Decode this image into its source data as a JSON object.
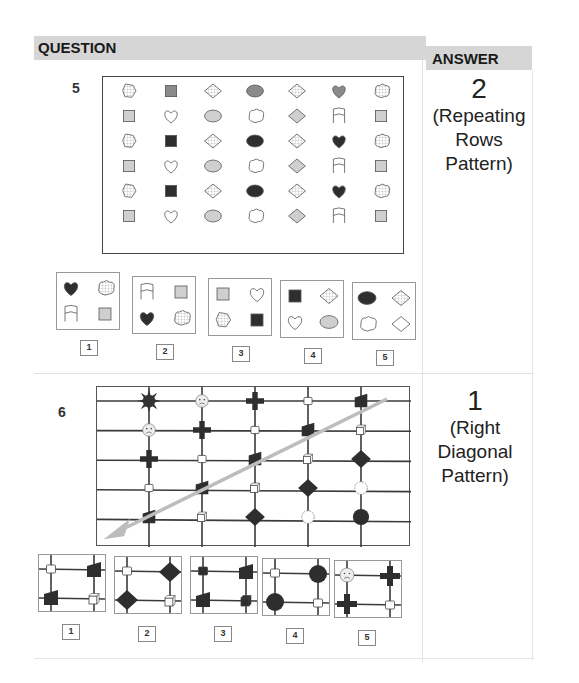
{
  "header": {
    "question_label": "QUESTION",
    "answer_label": "ANSWER"
  },
  "questions": [
    {
      "number": "5",
      "answer_number": "2",
      "answer_text_lines": [
        "(Repeating",
        "Rows",
        "Pattern)"
      ],
      "matrix_rows": [
        [
          "pentagon-hatched",
          "square-gray",
          "diamond-hatched",
          "ellipse-gray",
          "diamond-hatched",
          "heart-gray",
          "cloud-hatched"
        ],
        [
          "square-light",
          "heart-outline",
          "ellipse-light",
          "cloud-outline",
          "diamond-light",
          "banner-outline",
          "square-light"
        ],
        [
          "pentagon-hatched",
          "square-dark",
          "diamond-hatched",
          "ellipse-dark",
          "diamond-hatched",
          "heart-dark",
          "cloud-hatched"
        ],
        [
          "square-light",
          "heart-outline",
          "ellipse-light",
          "cloud-outline",
          "diamond-light",
          "banner-outline",
          "square-light"
        ],
        [
          "pentagon-hatched",
          "square-dark",
          "diamond-hatched",
          "ellipse-dark",
          "diamond-hatched",
          "heart-dark",
          "cloud-hatched"
        ],
        [
          "square-light",
          "heart-outline",
          "ellipse-light",
          "cloud-outline",
          "diamond-light",
          "banner-outline",
          "square-light"
        ]
      ],
      "options": [
        {
          "label": "1",
          "cells": [
            "heart-dark",
            "cloud-hatched",
            "banner-outline",
            "square-light"
          ]
        },
        {
          "label": "2",
          "cells": [
            "banner-outline",
            "square-light",
            "heart-dark",
            "cloud-hatched"
          ]
        },
        {
          "label": "3",
          "cells": [
            "square-light",
            "heart-outline",
            "pentagon-hatched",
            "square-dark"
          ]
        },
        {
          "label": "4",
          "cells": [
            "square-dark",
            "diamond-hatched",
            "heart-outline",
            "ellipse-light"
          ]
        },
        {
          "label": "5",
          "cells": [
            "ellipse-dark",
            "diamond-hatched",
            "cloud-outline",
            "diamond-outline"
          ]
        }
      ]
    },
    {
      "number": "6",
      "answer_number": "1",
      "answer_text_lines": [
        "(Right",
        "Diagonal",
        "Pattern)"
      ],
      "grid_nodes": [
        [
          "sun",
          "sad-face",
          "cross",
          "small-square",
          "trapezoid"
        ],
        [
          "sad-face",
          "cross",
          "small-square",
          "trapezoid",
          "cube"
        ],
        [
          "cross",
          "small-square",
          "trapezoid",
          "cube",
          "diamond"
        ],
        [
          "small-square",
          "trapezoid",
          "cube",
          "diamond",
          "cloud"
        ],
        [
          "trapezoid",
          "cube",
          "diamond",
          "cloud",
          "circle"
        ]
      ],
      "arrow_direction": "top-right to bottom-left",
      "options": [
        {
          "label": "1",
          "cells": [
            "small-square",
            "trapezoid",
            "trapezoid",
            "cube"
          ]
        },
        {
          "label": "2",
          "cells": [
            "small-square",
            "diamond",
            "diamond",
            "cube"
          ]
        },
        {
          "label": "3",
          "cells": [
            "small-square-dark",
            "trapezoid",
            "trapezoid",
            "cube-dark"
          ]
        },
        {
          "label": "4",
          "cells": [
            "small-square",
            "circle",
            "circle",
            "small-square"
          ]
        },
        {
          "label": "5",
          "cells": [
            "sad-face",
            "cross",
            "cross",
            "small-square"
          ]
        }
      ]
    }
  ],
  "colors": {
    "header_bg": "#d6d6d6",
    "dark_fill": "#2e2e2e",
    "gray_fill": "#8a8a8a",
    "light_fill": "#cfcfcf",
    "arrow": "#bdbdbd"
  }
}
